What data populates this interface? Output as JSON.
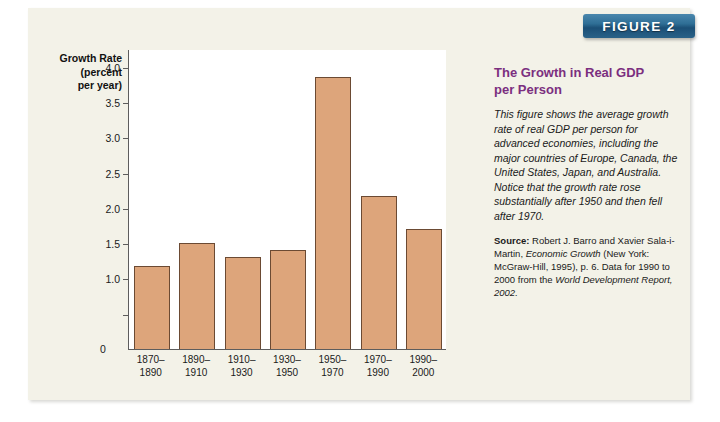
{
  "figure_banner": {
    "label": "FIGURE 2"
  },
  "side": {
    "title_line1": "The Growth in Real GDP",
    "title_line2": "per Person",
    "caption": "This figure shows the average growth rate of real GDP per person for advanced economies, including the major countries of Europe, Canada, the United States, Japan, and Australia. Notice that the growth rate rose substantially after 1950 and then fell after 1970.",
    "source_label": "Source:",
    "source_part1": " Robert J. Barro and Xavier Sala-i-Martin, ",
    "source_italic1": "Economic Growth",
    "source_part2": " (New York: McGraw-Hill, 1995), p. 6. Data for 1990 to 2000 from the ",
    "source_italic2": "World Development Report, 2002.",
    "accent_color": "#7b2f7f"
  },
  "chart_data": {
    "type": "bar",
    "title": "The Growth in Real GDP per Person",
    "ylabel_line1": "Growth Rate",
    "ylabel_line2": "(percent",
    "ylabel_line3": "per year)",
    "xlabel": "",
    "categories": [
      "1870–\n1890",
      "1890–\n1910",
      "1910–\n1930",
      "1930–\n1950",
      "1950–\n1970",
      "1970–\n1990",
      "1990–\n2000"
    ],
    "category_lines": [
      [
        "1870–",
        "1890"
      ],
      [
        "1890–",
        "1910"
      ],
      [
        "1910–",
        "1930"
      ],
      [
        "1930–",
        "1950"
      ],
      [
        "1950–",
        "1970"
      ],
      [
        "1970–",
        "1990"
      ],
      [
        "1990–",
        "2000"
      ]
    ],
    "values": [
      1.17,
      1.5,
      1.31,
      1.4,
      3.85,
      2.17,
      1.7
    ],
    "ylim": [
      0,
      4.25
    ],
    "yticks": [
      0,
      0.5,
      1.0,
      1.5,
      2.0,
      2.5,
      3.0,
      3.5,
      4.0
    ],
    "ytick_labels": [
      "0",
      "",
      "1.0",
      "1.5",
      "2.0",
      "2.5",
      "3.0",
      "3.5",
      "4.0"
    ],
    "grid": false,
    "legend": null,
    "bar_color": "#dda57b",
    "bar_border_color": "#6b4a33"
  }
}
